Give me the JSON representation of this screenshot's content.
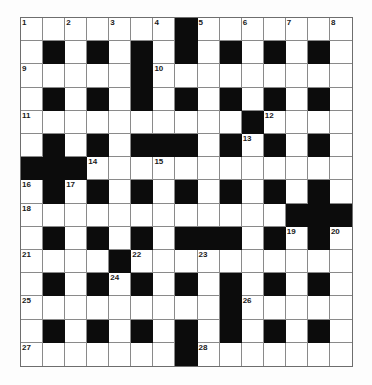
{
  "puzzle": {
    "rows": 15,
    "cols": 15,
    "grid": [
      ".......#.......",
      ".#.#.#.#.#.#.#.",
      ".....#.........",
      ".#.#.#.#.#.#.#.",
      "..........#....",
      ".#.#.###.#.#.#.",
      "###............",
      ".#.#.#.#.#.#.#.",
      "............###",
      ".#.#.#.###.#.#.",
      "....#..........",
      ".#.#.#.#.#.#.#.",
      ".........#.....",
      ".#.#.#.#.#.#.#.",
      ".......#......."
    ],
    "numbers": [
      {
        "n": "1",
        "r": 0,
        "c": 0
      },
      {
        "n": "2",
        "r": 0,
        "c": 2
      },
      {
        "n": "3",
        "r": 0,
        "c": 4
      },
      {
        "n": "4",
        "r": 0,
        "c": 6
      },
      {
        "n": "5",
        "r": 0,
        "c": 8
      },
      {
        "n": "6",
        "r": 0,
        "c": 10
      },
      {
        "n": "7",
        "r": 0,
        "c": 12
      },
      {
        "n": "8",
        "r": 0,
        "c": 14
      },
      {
        "n": "9",
        "r": 2,
        "c": 0
      },
      {
        "n": "10",
        "r": 2,
        "c": 6
      },
      {
        "n": "11",
        "r": 4,
        "c": 0
      },
      {
        "n": "12",
        "r": 4,
        "c": 11
      },
      {
        "n": "13",
        "r": 5,
        "c": 10
      },
      {
        "n": "14",
        "r": 6,
        "c": 3
      },
      {
        "n": "15",
        "r": 6,
        "c": 6
      },
      {
        "n": "16",
        "r": 7,
        "c": 0
      },
      {
        "n": "17",
        "r": 7,
        "c": 2
      },
      {
        "n": "18",
        "r": 8,
        "c": 0
      },
      {
        "n": "19",
        "r": 9,
        "c": 12
      },
      {
        "n": "20",
        "r": 9,
        "c": 14
      },
      {
        "n": "21",
        "r": 10,
        "c": 0
      },
      {
        "n": "22",
        "r": 10,
        "c": 5
      },
      {
        "n": "23",
        "r": 10,
        "c": 8
      },
      {
        "n": "24",
        "r": 11,
        "c": 4
      },
      {
        "n": "25",
        "r": 12,
        "c": 0
      },
      {
        "n": "26",
        "r": 12,
        "c": 10
      },
      {
        "n": "27",
        "r": 14,
        "c": 0
      },
      {
        "n": "28",
        "r": 14,
        "c": 8
      }
    ],
    "colors": {
      "block": "#0c0c0c",
      "cell": "#ffffff",
      "line": "#8a8a8a"
    }
  }
}
